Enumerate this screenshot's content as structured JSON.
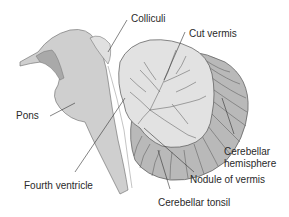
{
  "diagram": {
    "labels": {
      "colliculi": "Colliculi",
      "cut_vermis": "Cut vermis",
      "pons": "Pons",
      "cerebellar_hemisphere_line1": "Cerebellar",
      "cerebellar_hemisphere_line2": "hemisphere",
      "fourth_ventricle": "Fourth ventricle",
      "nodule_of_vermis": "Nodule of vermis",
      "cerebellar_tonsil": "Cerebellar tonsil"
    },
    "colors": {
      "brainstem_fill": "#cfcfcf",
      "brainstem_dark": "#a9a9a9",
      "vermis_fill": "#e2e2e2",
      "hemisphere_fill": "#b9b9b9",
      "outline": "#555555",
      "leader_line": "#333333",
      "text": "#2a2a2a"
    }
  }
}
